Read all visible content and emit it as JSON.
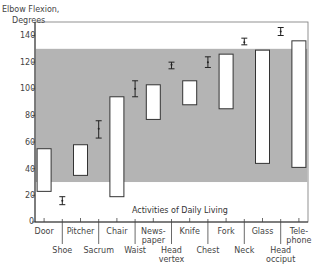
{
  "chart_data": {
    "type": "bar",
    "subtype": "floating-range-bars-with-error-bars",
    "title": "",
    "ylabel": "Elbow Flexion, Degrees",
    "xlabel": "Activities of Daily Living",
    "ylim": [
      0,
      140
    ],
    "yticks": [
      0,
      20,
      40,
      60,
      80,
      100,
      120,
      140
    ],
    "grid": false,
    "shaded_band": {
      "from": 30,
      "to": 130,
      "color": "#b4b4b4",
      "meaning": "functional range"
    },
    "categories": [
      "Door",
      "Shoe",
      "Pitcher",
      "Sacrum",
      "Chair",
      "Waist",
      "Newspaper",
      "Head vertex",
      "Knife",
      "Chest",
      "Fork",
      "Neck",
      "Glass",
      "Head occiput",
      "Telephone"
    ],
    "range_bars": [
      {
        "label": "Door",
        "min": 23,
        "max": 55
      },
      {
        "label": "Pitcher",
        "min": 35,
        "max": 58
      },
      {
        "label": "Chair",
        "min": 19,
        "max": 94
      },
      {
        "label": "Newspaper",
        "min": 77,
        "max": 103
      },
      {
        "label": "Knife",
        "min": 88,
        "max": 106
      },
      {
        "label": "Fork",
        "min": 85,
        "max": 126
      },
      {
        "label": "Glass",
        "min": 44,
        "max": 129
      },
      {
        "label": "Telephone",
        "min": 41,
        "max": 136
      }
    ],
    "error_bars": [
      {
        "label": "Shoe",
        "mean": 16,
        "low": 13,
        "high": 19
      },
      {
        "label": "Sacrum",
        "mean": 70,
        "low": 63,
        "high": 76
      },
      {
        "label": "Waist",
        "mean": 100,
        "low": 94,
        "high": 106
      },
      {
        "label": "Head vertex",
        "mean": 118,
        "low": 115,
        "high": 120
      },
      {
        "label": "Chest",
        "mean": 120,
        "low": 116,
        "high": 124
      },
      {
        "label": "Neck",
        "mean": 135,
        "low": 133,
        "high": 138
      },
      {
        "label": "Head occiput",
        "mean": 143,
        "low": 140,
        "high": 146
      }
    ]
  },
  "axis": {
    "title_line1": "Elbow Flexion,",
    "title_line2": "Degrees",
    "ticks": [
      "140",
      "120",
      "100",
      "80",
      "60",
      "40",
      "20",
      "0"
    ],
    "subtitle": "Activities of Daily Living"
  },
  "xlabels_upper": [
    {
      "line1": "Door",
      "line2": ""
    },
    {
      "line1": "Pitcher",
      "line2": ""
    },
    {
      "line1": "Chair",
      "line2": ""
    },
    {
      "line1": "News-",
      "line2": "paper"
    },
    {
      "line1": "Knife",
      "line2": ""
    },
    {
      "line1": "Fork",
      "line2": ""
    },
    {
      "line1": "Glass",
      "line2": ""
    },
    {
      "line1": "Tele-",
      "line2": "phone"
    }
  ],
  "xlabels_lower": [
    {
      "line1": "Shoe",
      "line2": ""
    },
    {
      "line1": "Sacrum",
      "line2": ""
    },
    {
      "line1": "Waist",
      "line2": ""
    },
    {
      "line1": "Head",
      "line2": "vertex"
    },
    {
      "line1": "Chest",
      "line2": ""
    },
    {
      "line1": "Neck",
      "line2": ""
    },
    {
      "line1": "Head",
      "line2": "occiput"
    }
  ],
  "colors": {
    "band": "#b4b4b4",
    "bar_fill": "#ffffff",
    "stroke": "#333333"
  }
}
